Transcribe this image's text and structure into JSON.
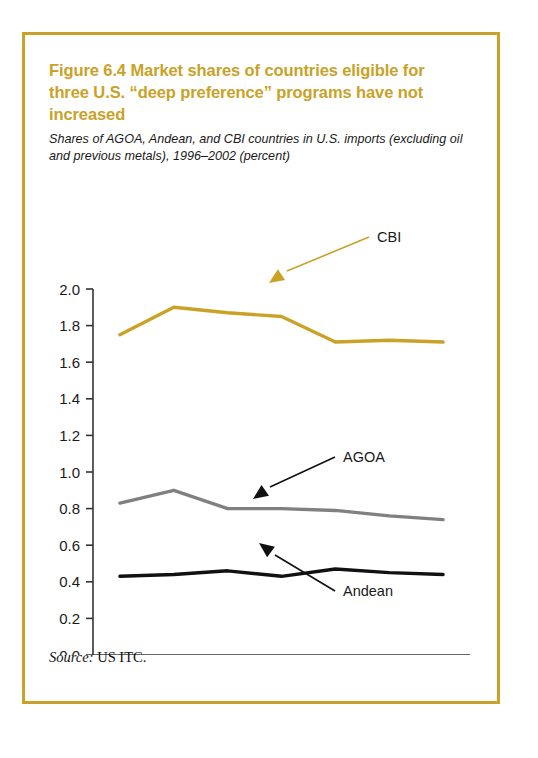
{
  "figure": {
    "title": "Figure 6.4  Market shares of countries eligible for three U.S. “deep preference” programs have not increased",
    "subtitle": "Shares of AGOA, Andean, and CBI countries in U.S. imports (excluding oil and previous metals), 1996–2002 (percent)",
    "source_label": "Source:",
    "source_value": "US ITC.",
    "border_color": "#C9A227",
    "title_color": "#C9A227"
  },
  "chart_data": {
    "type": "line",
    "title": "Figure 6.4  Market shares of countries eligible for three U.S. “deep preference” programs have not increased",
    "subtitle": "Shares of AGOA, Andean, and CBI countries in U.S. imports (excluding oil and previous metals), 1996–2002 (percent)",
    "xlabel": "",
    "ylabel": "percent",
    "x": [
      1996,
      1997,
      1998,
      1999,
      2000,
      2001,
      2002
    ],
    "categories": [
      "1996",
      "1997",
      "1998",
      "1999",
      "2000",
      "2001",
      "2002"
    ],
    "ylim": [
      0.0,
      2.0
    ],
    "yticks": [
      0.0,
      0.2,
      0.4,
      0.6,
      0.8,
      1.0,
      1.2,
      1.4,
      1.6,
      1.8,
      2.0
    ],
    "ytick_labels": [
      "0.0",
      "0.2",
      "0.4",
      "0.6",
      "0.8",
      "1.0",
      "1.2",
      "1.4",
      "1.6",
      "1.8",
      "2.0"
    ],
    "grid": false,
    "legend": "inline-annotations",
    "series": [
      {
        "name": "CBI",
        "color": "#C9A227",
        "values": [
          1.75,
          1.9,
          1.87,
          1.85,
          1.71,
          1.72,
          1.71
        ]
      },
      {
        "name": "AGOA",
        "color": "#808080",
        "values": [
          0.83,
          0.9,
          0.8,
          0.8,
          0.79,
          0.76,
          0.74
        ]
      },
      {
        "name": "Andean",
        "color": "#111111",
        "values": [
          0.43,
          0.44,
          0.46,
          0.43,
          0.47,
          0.45,
          0.44
        ]
      }
    ],
    "annotations": [
      {
        "text": "CBI",
        "series": "CBI",
        "color": "#C9A227"
      },
      {
        "text": "AGOA",
        "series": "AGOA",
        "color": "#111111"
      },
      {
        "text": "Andean",
        "series": "Andean",
        "color": "#111111"
      }
    ]
  }
}
